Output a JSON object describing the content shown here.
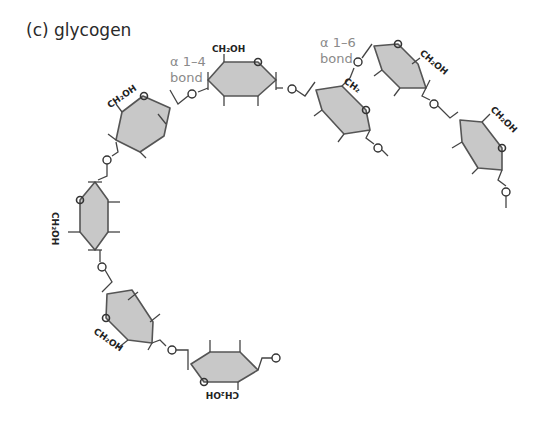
{
  "title": "(c) glycogen",
  "labels": {
    "alpha14": "α 1–4",
    "alpha14_bond": "bond",
    "alpha16": "α 1–6",
    "alpha16_bond": "bond",
    "ch2oh": "CH₂OH",
    "ch2": "CH₂",
    "o": "O"
  },
  "colors": {
    "ring_fill": "#c8c8c8",
    "ring_stroke": "#555555",
    "bond_label": "#8a8a8a",
    "text": "#2a2a2a"
  },
  "residues": [
    {
      "name": "glucose-1",
      "position": "top-center",
      "substituent": "CH₂OH"
    },
    {
      "name": "glucose-2",
      "position": "upper-left",
      "substituent": "CH₂OH"
    },
    {
      "name": "glucose-3",
      "position": "left",
      "substituent": "CH₂OH"
    },
    {
      "name": "glucose-4",
      "position": "lower-left",
      "substituent": "CH₂OH"
    },
    {
      "name": "glucose-5",
      "position": "bottom",
      "substituent": "CH₂OH"
    },
    {
      "name": "glucose-6",
      "position": "branch-point",
      "substituent": "CH₂"
    },
    {
      "name": "glucose-7",
      "position": "branch-top-right",
      "substituent": "CH₂OH"
    },
    {
      "name": "glucose-8",
      "position": "far-right",
      "substituent": "CH₂OH"
    }
  ]
}
